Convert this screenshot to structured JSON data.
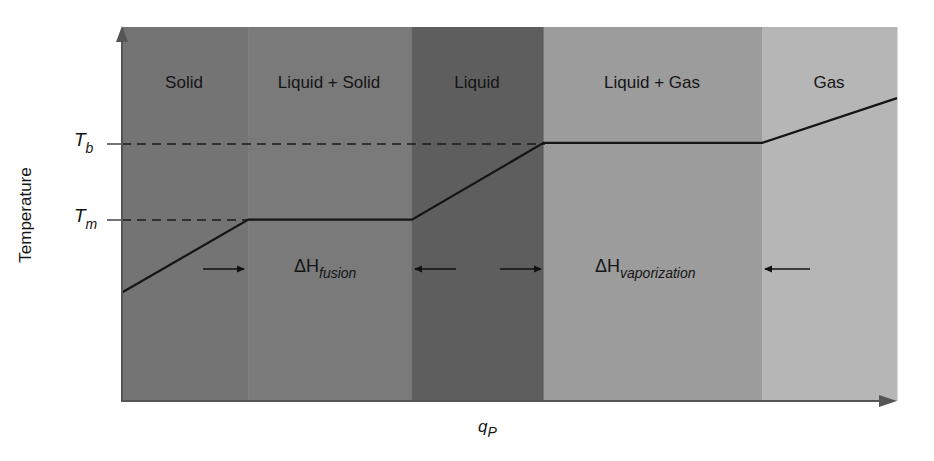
{
  "chart_data": {
    "type": "line",
    "title": "",
    "xlabel": "q",
    "xlabel_subscript": "P",
    "ylabel": "Temperature",
    "grid": false,
    "legend": "none",
    "x_ticks": [],
    "y_ticks": [
      {
        "label": "T",
        "subscript": "b",
        "meaning": "boiling point"
      },
      {
        "label": "T",
        "subscript": "m",
        "meaning": "melting point"
      }
    ],
    "regions": [
      {
        "label": "Solid",
        "x_start": 0,
        "x_end": 16.3,
        "color": "#747474"
      },
      {
        "label": "Liquid + Solid",
        "x_start": 16.3,
        "x_end": 37.4,
        "color": "#7a7a7a"
      },
      {
        "label": "Liquid",
        "x_start": 37.4,
        "x_end": 54.4,
        "color": "#5e5e5e"
      },
      {
        "label": "Liquid + Gas",
        "x_start": 54.4,
        "x_end": 82.6,
        "color": "#9c9c9c"
      },
      {
        "label": "Gas",
        "x_start": 82.6,
        "x_end": 100,
        "color": "#b6b6b6"
      }
    ],
    "series": [
      {
        "name": "Heating curve",
        "x": [
          0,
          16.3,
          37.4,
          54.4,
          82.6,
          100
        ],
        "y": [
          29,
          48.5,
          48.5,
          69,
          69,
          81
        ]
      }
    ],
    "reference_lines": [
      {
        "label": "T_b",
        "y": 69,
        "style": "dashed"
      },
      {
        "label": "T_m",
        "y": 48.5,
        "style": "dashed"
      }
    ],
    "annotations": [
      {
        "text": "ΔH",
        "subscript": "fusion",
        "between_regions": [
          "Solid",
          "Liquid"
        ],
        "arrows": "inward"
      },
      {
        "text": "ΔH",
        "subscript": "vaporization",
        "between_regions": [
          "Liquid",
          "Gas"
        ],
        "arrows": "inward"
      }
    ],
    "xlim": [
      0,
      100
    ],
    "ylim": [
      0,
      100
    ]
  },
  "labels": {
    "regions": [
      "Solid",
      "Liquid + Solid",
      "Liquid",
      "Liquid + Gas",
      "Gas"
    ],
    "tb_main": "T",
    "tb_sub": "b",
    "tm_main": "T",
    "tm_sub": "m",
    "ylabel": "Temperature",
    "xlabel_main": "q",
    "xlabel_sub": "P",
    "dh_symbol": "ΔH",
    "dh_fusion_sub": "fusion",
    "dh_vap_sub": "vaporization"
  }
}
